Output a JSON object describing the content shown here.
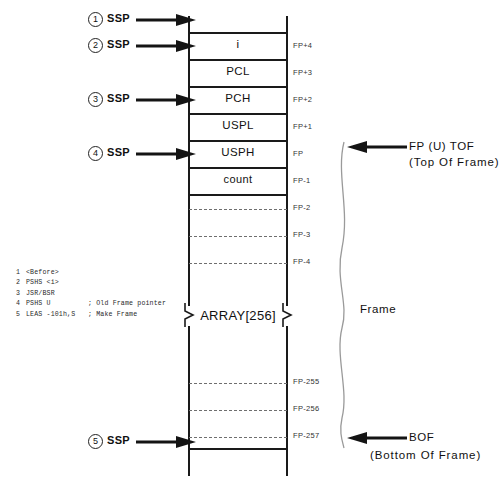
{
  "diagram": {
    "stack_cells": [
      {
        "label": "",
        "fp": ""
      },
      {
        "label": "i",
        "fp": "FP+4"
      },
      {
        "label": "PCL",
        "fp": "FP+3"
      },
      {
        "label": "PCH",
        "fp": "FP+2"
      },
      {
        "label": "USPL",
        "fp": "FP+1"
      },
      {
        "label": "USPH",
        "fp": "FP"
      },
      {
        "label": "count",
        "fp": "FP-1"
      },
      {
        "label": "",
        "fp": "FP-2"
      },
      {
        "label": "",
        "fp": "FP-3"
      },
      {
        "label": "",
        "fp": "FP-4"
      },
      {
        "label": "",
        "fp": "FP-255"
      },
      {
        "label": "",
        "fp": "FP-256"
      },
      {
        "label": "",
        "fp": "FP-257"
      }
    ],
    "array_label": "ARRAY[256]",
    "frame_label": "Frame",
    "markers": [
      {
        "num": "1",
        "label": "SSP"
      },
      {
        "num": "2",
        "label": "SSP"
      },
      {
        "num": "3",
        "label": "SSP"
      },
      {
        "num": "4",
        "label": "SSP"
      },
      {
        "num": "5",
        "label": "SSP"
      }
    ],
    "annotations": {
      "tof_line1": "FP (U) TOF",
      "tof_line2": "(Top Of Frame)",
      "bof_line1": "BOF",
      "bof_line2": "(Bottom Of Frame)"
    },
    "legend": [
      {
        "n": "1",
        "op": "<Before>",
        "comment": ""
      },
      {
        "n": "2",
        "op": "PSHS <i>",
        "comment": ""
      },
      {
        "n": "3",
        "op": "JSR/BSR",
        "comment": ""
      },
      {
        "n": "4",
        "op": "PSHS U",
        "comment": "; Old Frame pointer"
      },
      {
        "n": "5",
        "op": "LEAS -101h,S",
        "comment": "; Make Frame"
      }
    ],
    "colors": {
      "line": "#1a1a1a",
      "dash": "#6e6e6e",
      "text": "#111111",
      "background": "#ffffff"
    }
  }
}
